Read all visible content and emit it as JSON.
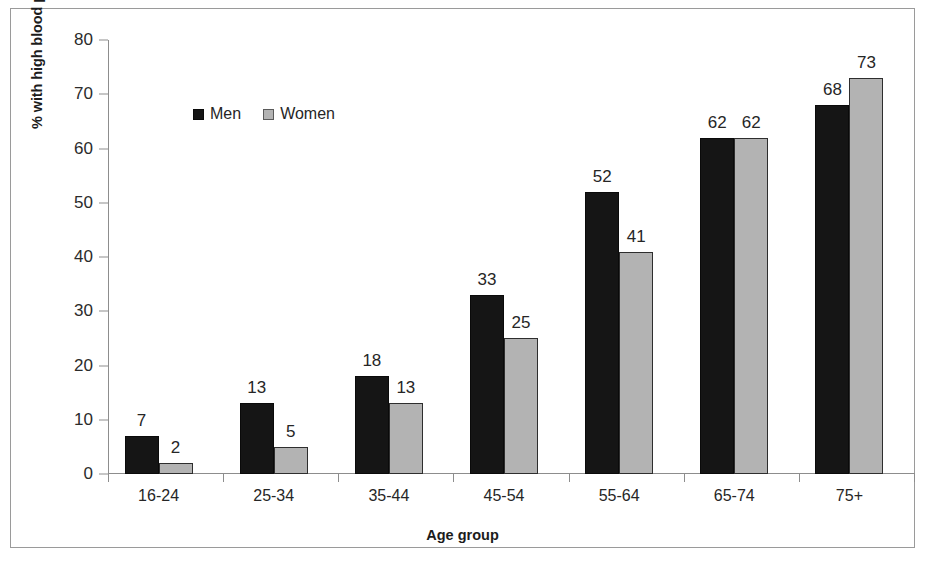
{
  "chart_data": {
    "type": "bar",
    "title": "",
    "xlabel": "Age group",
    "ylabel": "% with high blood pressure",
    "categories": [
      "16-24",
      "25-34",
      "35-44",
      "45-54",
      "55-64",
      "65-74",
      "75+"
    ],
    "series": [
      {
        "name": "Men",
        "color": "#151515",
        "values": [
          7,
          13,
          18,
          33,
          52,
          62,
          68
        ]
      },
      {
        "name": "Women",
        "color": "#b3b3b3",
        "values": [
          2,
          5,
          13,
          25,
          41,
          62,
          73
        ]
      }
    ],
    "ylim": [
      0,
      80
    ],
    "yticks": [
      0,
      10,
      20,
      30,
      40,
      50,
      60,
      70,
      80
    ],
    "grid": false,
    "legend_position": "upper-left-inside",
    "data_labels": true
  },
  "axis": {
    "y_title": "% with high blood pressure",
    "x_title": "Age group"
  },
  "legend": {
    "items": [
      {
        "label": "Men",
        "swatch": "men-swatch"
      },
      {
        "label": "Women",
        "swatch": "women-swatch"
      }
    ]
  },
  "colors": {
    "men": "#151515",
    "women": "#b3b3b3",
    "axis": "#8d8d8d",
    "frame": "#9a9a9a",
    "text": "#262626",
    "background": "#ffffff"
  }
}
